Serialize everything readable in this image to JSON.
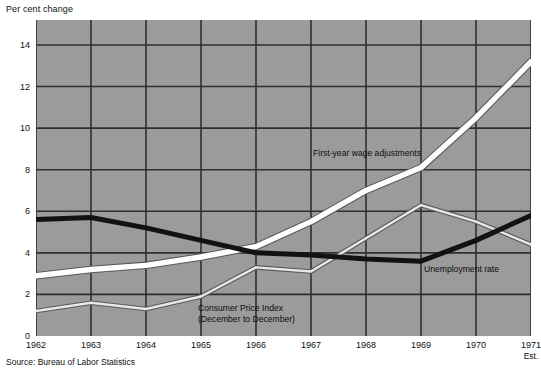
{
  "chart_data": {
    "type": "line",
    "title": "",
    "ylabel": "Per cent change",
    "xlabel": "",
    "ylim": [
      0,
      15.2
    ],
    "xlim": [
      1962,
      1971
    ],
    "yticks": [
      0,
      2,
      4,
      6,
      8,
      10,
      12,
      14
    ],
    "grid": true,
    "legend_position": "inline-annotations",
    "categories": [
      1962,
      1963,
      1964,
      1965,
      1966,
      1967,
      1968,
      1969,
      1970,
      1971
    ],
    "xtick_labels": [
      "1962",
      "1963",
      "1964",
      "1965",
      "1966",
      "1967",
      "1968",
      "1969",
      "1970",
      "1971"
    ],
    "xtick_sublabels": [
      "",
      "",
      "",
      "",
      "",
      "",
      "",
      "",
      "",
      "Est."
    ],
    "series": [
      {
        "name": "First-year wage adjustments",
        "color": "#ffffff",
        "values": [
          2.9,
          3.2,
          3.4,
          3.8,
          4.3,
          5.5,
          7.0,
          8.1,
          10.5,
          13.2
        ]
      },
      {
        "name": "Unemployment rate",
        "color": "#121212",
        "values": [
          5.6,
          5.7,
          5.2,
          4.6,
          4.0,
          3.9,
          3.7,
          3.6,
          4.6,
          5.8
        ]
      },
      {
        "name": "Consumer Price Index",
        "color": "#e8e8e8",
        "values": [
          1.2,
          1.6,
          1.3,
          1.9,
          3.3,
          3.1,
          4.7,
          6.3,
          5.5,
          4.4
        ]
      }
    ],
    "annotations": [
      {
        "id": "wage",
        "text": "First-year wage adjustments"
      },
      {
        "id": "cpi_line1",
        "text": "Consumer Price Index"
      },
      {
        "id": "cpi_line2",
        "text": "(December to December)"
      },
      {
        "id": "unemployment",
        "text": "Unemployment rate"
      }
    ],
    "source": "Source: Bureau of Labor Statistics",
    "colors": {
      "plot_background": "#9b9b9b",
      "gridline": "#2f2f2f",
      "page_background": "#ffffff",
      "text": "#111111"
    }
  },
  "labels": {
    "y_axis_title": "Per cent change",
    "source": "Source: Bureau of Labor Statistics",
    "wage_series": "First-year wage adjustments",
    "cpi_series_line1": "Consumer Price Index",
    "cpi_series_line2": "(December to December)",
    "unemployment_series": "Unemployment rate"
  }
}
